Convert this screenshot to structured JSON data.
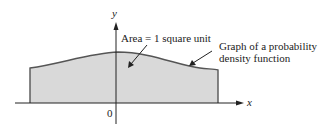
{
  "diagram": {
    "axes": {
      "x_label": "x",
      "y_label": "y",
      "origin_label": "0"
    },
    "annotations": {
      "area": "Area = 1 square unit",
      "graph_line1": "Graph of a probability",
      "graph_line2": "density function"
    },
    "colors": {
      "fill": "#d9d9d9",
      "curve": "#555555",
      "axis": "#222222"
    }
  }
}
